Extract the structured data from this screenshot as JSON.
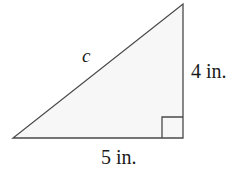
{
  "figure": {
    "kind": "right-triangle-diagram",
    "background_color": "#ffffff",
    "stroke_color": "#4a4a4a",
    "fill_color": "#f7f7f7",
    "text_color": "#1a1a1a",
    "labels": {
      "hypotenuse": "c",
      "vertical_leg": "4 in.",
      "horizontal_leg": "5 in."
    },
    "geometry": {
      "apex": [
        183,
        4
      ],
      "bottom_right": [
        183,
        138
      ],
      "bottom_left": [
        13,
        138
      ],
      "right_angle_marker": {
        "corner": [
          183,
          138
        ],
        "size": 21
      }
    },
    "measures": {
      "vertical_leg_value": 4,
      "horizontal_leg_value": 5,
      "unit": "in.",
      "hypotenuse_variable": "c"
    }
  }
}
